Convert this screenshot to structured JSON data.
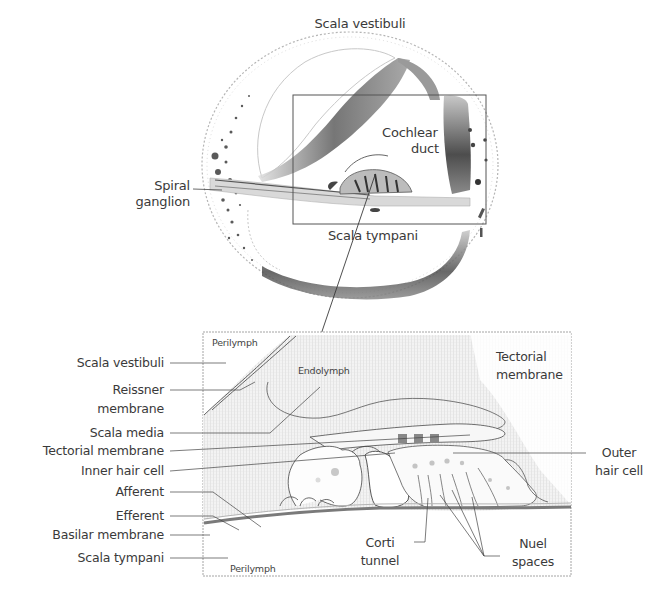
{
  "figure": {
    "top_panel": {
      "name": "Cochlea cross-section",
      "labels": {
        "scala_vestibuli": "Scala vestibuli",
        "cochlear_duct_line1": "Cochlear",
        "cochlear_duct_line2": "duct",
        "spiral_ganglion_line1": "Spiral",
        "spiral_ganglion_line2": "ganglion",
        "scala_tympani": "Scala tympani"
      }
    },
    "bottom_panel": {
      "name": "Organ of Corti detail",
      "inner_labels": {
        "perilymph_top": "Perilymph",
        "endolymph": "Endolymph",
        "perilymph_bottom": "Perilymph"
      },
      "left_labels": [
        "Scala vestibuli",
        "Reissner",
        "membrane",
        "Scala media",
        "Tectorial membrane",
        "Inner hair cell",
        "Afferent",
        "Efferent",
        "Basilar membrane",
        "Scala tympani"
      ],
      "right_labels": {
        "tectorial_line1": "Tectorial",
        "tectorial_line2": "membrane",
        "outer_hair_line1": "Outer",
        "outer_hair_line2": "hair cell",
        "nuel_line1": "Nuel",
        "nuel_line2": "spaces",
        "corti_line1": "Corti",
        "corti_line2": "tunnel"
      }
    },
    "colors": {
      "line": "#3a3a3a",
      "bony_wall": "#6b6b6b",
      "hatch_fill": "#e9e9e9",
      "basilar": "#7a7a7a"
    }
  }
}
